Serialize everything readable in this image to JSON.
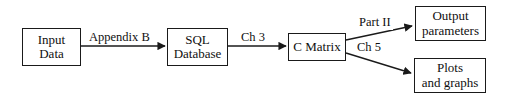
{
  "diagram": {
    "background_color": "#ffffff",
    "stroke_color": "#1a1a1a",
    "text_color": "#101010",
    "nodes": [
      {
        "id": "input-data",
        "lines": [
          "Input",
          "Data"
        ]
      },
      {
        "id": "sql-database",
        "lines": [
          "SQL",
          "Database"
        ]
      },
      {
        "id": "c-matrix",
        "lines": [
          "C Matrix"
        ]
      },
      {
        "id": "output-params",
        "lines": [
          "Output",
          "parameters"
        ]
      },
      {
        "id": "plots-graphs",
        "lines": [
          "Plots",
          "and graphs"
        ]
      }
    ],
    "edges": [
      {
        "id": "input-to-sql",
        "from": "input-data",
        "to": "sql-database",
        "label": "Appendix B"
      },
      {
        "id": "sql-to-cmatrix",
        "from": "sql-database",
        "to": "c-matrix",
        "label": "Ch 3"
      },
      {
        "id": "cmatrix-to-output",
        "from": "c-matrix",
        "to": "output-params",
        "label": "Part II"
      },
      {
        "id": "cmatrix-to-plots",
        "from": "c-matrix",
        "to": "plots-graphs",
        "label": "Ch 5"
      }
    ]
  }
}
